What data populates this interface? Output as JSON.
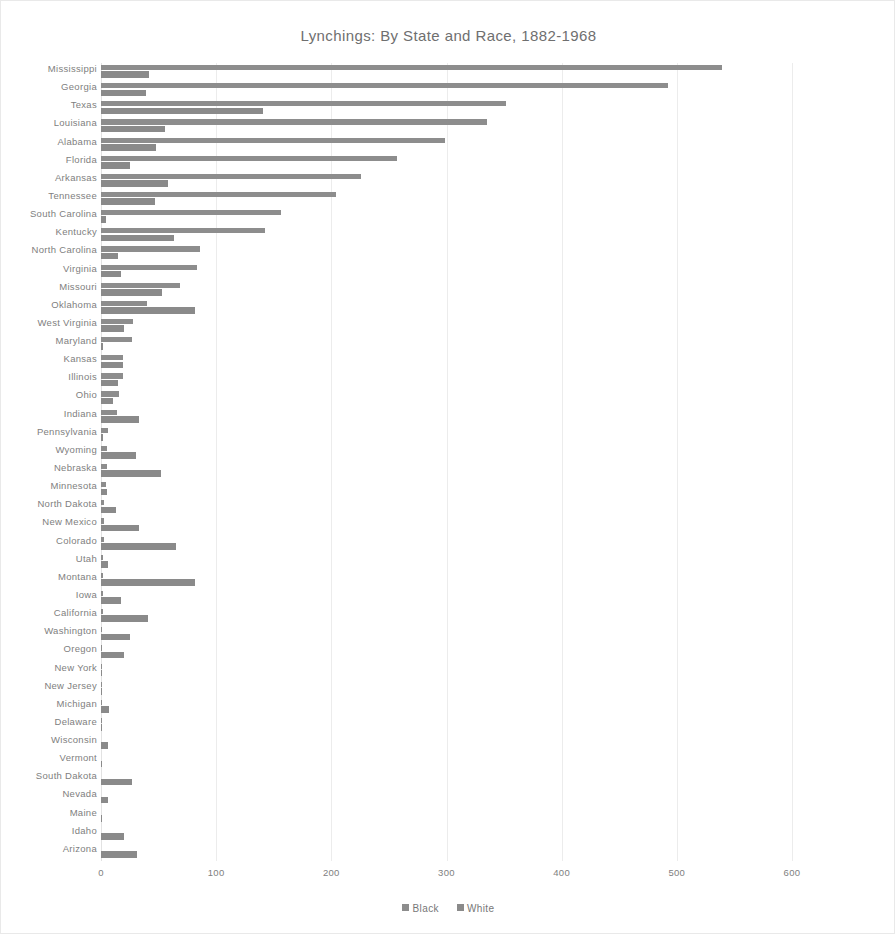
{
  "chart_data": {
    "type": "bar",
    "orientation": "horizontal",
    "title": "Lynchings: By State and Race, 1882-1968",
    "xlabel": "",
    "ylabel": "",
    "xlim": [
      0,
      600
    ],
    "xticks": [
      0,
      100,
      200,
      300,
      400,
      500,
      600
    ],
    "grid": true,
    "legend_position": "bottom",
    "colors": {
      "black_series": "#8d8d8d",
      "white_series": "#8a8a8a",
      "gridline": "#ececec",
      "text": "#808080",
      "background": "#ffffff",
      "frame": "#e9e9e9"
    },
    "categories": [
      "Mississippi",
      "Georgia",
      "Texas",
      "Louisiana",
      "Alabama",
      "Florida",
      "Arkansas",
      "Tennessee",
      "South Carolina",
      "Kentucky",
      "North Carolina",
      "Virginia",
      "Missouri",
      "Oklahoma",
      "West Virginia",
      "Maryland",
      "Kansas",
      "Illinois",
      "Ohio",
      "Indiana",
      "Pennsylvania",
      "Wyoming",
      "Nebraska",
      "Minnesota",
      "North Dakota",
      "New Mexico",
      "Colorado",
      "Utah",
      "Montana",
      "Iowa",
      "California",
      "Washington",
      "Oregon",
      "New York",
      "New Jersey",
      "Michigan",
      "Delaware",
      "Wisconsin",
      "Vermont",
      "South Dakota",
      "Nevada",
      "Maine",
      "Idaho",
      "Arizona"
    ],
    "series": [
      {
        "name": "Black",
        "values": [
          539,
          492,
          352,
          335,
          299,
          257,
          226,
          204,
          156,
          142,
          86,
          83,
          69,
          40,
          28,
          27,
          19,
          19,
          16,
          14,
          6,
          5,
          5,
          4,
          3,
          3,
          3,
          2,
          2,
          2,
          2,
          1,
          1,
          1,
          1,
          1,
          1,
          0,
          0,
          0,
          0,
          0,
          0,
          0
        ]
      },
      {
        "name": "White",
        "values": [
          42,
          39,
          141,
          56,
          48,
          25,
          58,
          47,
          4,
          63,
          15,
          17,
          53,
          82,
          20,
          2,
          19,
          15,
          10,
          33,
          2,
          30,
          52,
          5,
          13,
          33,
          65,
          6,
          82,
          17,
          41,
          25,
          20,
          1,
          1,
          7,
          1,
          6,
          1,
          27,
          6,
          1,
          20,
          31
        ]
      }
    ],
    "legend_entries": [
      "Black",
      "White"
    ]
  }
}
